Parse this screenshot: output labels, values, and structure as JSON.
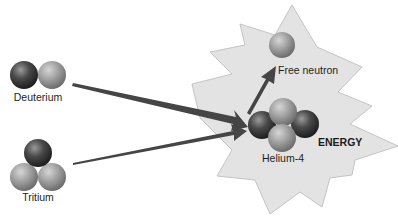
{
  "diagram": {
    "inputs": [
      {
        "label": "Deuterium",
        "protons": 1,
        "neutrons": 1
      },
      {
        "label": "Tritium",
        "protons": 1,
        "neutrons": 2
      }
    ],
    "outputs": [
      {
        "label": "Free neutron"
      },
      {
        "label": "Helium-4",
        "protons": 2,
        "neutrons": 2
      }
    ],
    "energy_label": "ENERGY",
    "colors": {
      "proton": "#3a3a3a",
      "neutron": "#9a9a9a",
      "burst_fill": "#e3e3e3",
      "burst_stroke": "#c4c4c4",
      "arrow": "#444444"
    }
  }
}
